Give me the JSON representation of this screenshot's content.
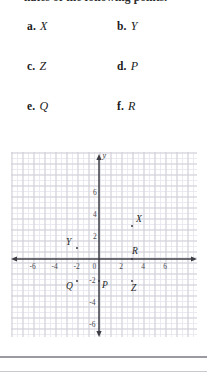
{
  "stem": {
    "text": "nates of the following points."
  },
  "choices": [
    {
      "tag": "a.",
      "point": "X",
      "col": "left",
      "row": 1
    },
    {
      "tag": "b.",
      "point": "Y",
      "col": "right",
      "row": 1
    },
    {
      "tag": "c.",
      "point": "Z",
      "col": "left",
      "row": 2
    },
    {
      "tag": "d.",
      "point": "P",
      "col": "right",
      "row": 2
    },
    {
      "tag": "e.",
      "point": "Q",
      "col": "left",
      "row": 3
    },
    {
      "tag": "f.",
      "point": "R",
      "col": "right",
      "row": 3
    }
  ],
  "chart_data": {
    "type": "scatter",
    "title": "",
    "xlabel": "x",
    "ylabel": "y",
    "xlim": [
      -8,
      8
    ],
    "ylim": [
      -7,
      7
    ],
    "grid": true,
    "grid_major_step": 1,
    "grid_minor_step": 0.5,
    "legend": "none",
    "xticks": [
      -6,
      -4,
      -2,
      0,
      2,
      4,
      6
    ],
    "xtick_labels": [
      "-6",
      "-4",
      "-2",
      "0",
      "2",
      "4",
      "6"
    ],
    "yticks": [
      6,
      4,
      2,
      0,
      -2,
      -4,
      -6
    ],
    "ytick_labels": [
      "6",
      "4",
      "2",
      "0",
      "-2",
      "-4",
      "-6"
    ],
    "axis_name_y": "y",
    "points": [
      {
        "name": "X",
        "x": 3,
        "y": 3,
        "label_dx": 4,
        "label_dy": -11
      },
      {
        "name": "Y",
        "x": -2,
        "y": 1,
        "label_dx": -11,
        "label_dy": -10
      },
      {
        "name": "R",
        "x": 3,
        "y": 0,
        "label_dx": 0,
        "label_dy": -12
      },
      {
        "name": "Q",
        "x": -2,
        "y": -2,
        "label_dx": -11,
        "label_dy": 1
      },
      {
        "name": "P",
        "x": 0,
        "y": -2,
        "label_dx": 3,
        "label_dy": 0
      },
      {
        "name": "Z",
        "x": 3,
        "y": -2,
        "label_dx": -1,
        "label_dy": 3
      }
    ]
  },
  "colors": {
    "axis": "#3d3d46",
    "grid_major": "#cfcfd8",
    "grid_minor": "#e9e9ef",
    "text": "#1c1c1c",
    "point": "#3a3a42",
    "rule": "#9a9aa2"
  }
}
